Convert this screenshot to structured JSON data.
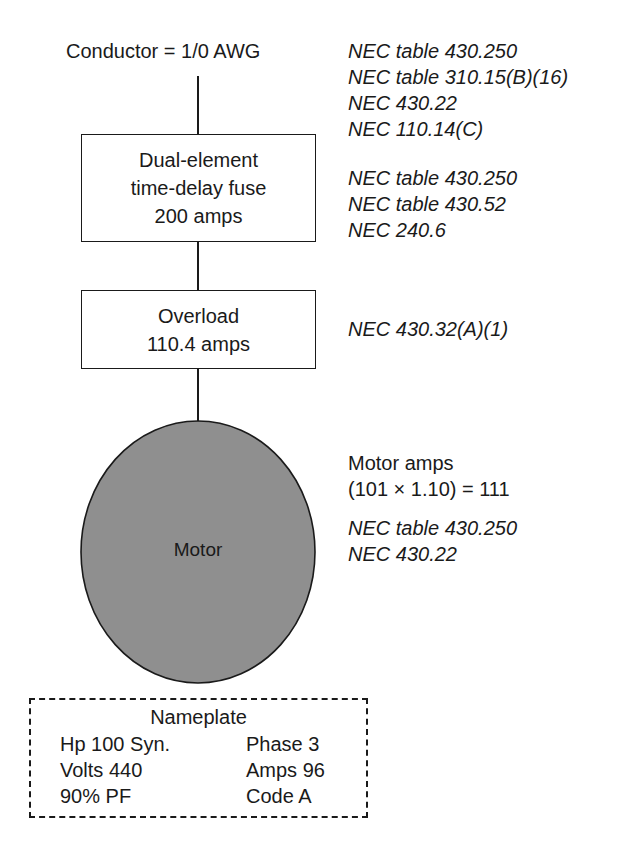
{
  "diagram": {
    "conductor_label": "Conductor = 1/0 AWG",
    "conductor_refs": [
      "NEC table 430.250",
      "NEC table 310.15(B)(16)",
      "NEC 430.22",
      "NEC 110.14(C)"
    ],
    "fuse": {
      "lines": [
        "Dual-element",
        "time-delay fuse",
        "200 amps"
      ],
      "refs": [
        "NEC table 430.250",
        "NEC table 430.52",
        "NEC 240.6"
      ]
    },
    "overload": {
      "lines": [
        "Overload",
        "110.4 amps"
      ],
      "refs": [
        "NEC 430.32(A)(1)"
      ]
    },
    "motor": {
      "label": "Motor",
      "fill_color": "#8f8f8f",
      "amps_lines": [
        "Motor amps",
        "(101 × 1.10) = 111"
      ],
      "refs": [
        "NEC table 430.250",
        "NEC 430.22"
      ]
    },
    "nameplate": {
      "title": "Nameplate",
      "left": [
        "Hp 100 Syn.",
        "Volts 440",
        "90% PF"
      ],
      "right": [
        "Phase 3",
        "Amps 96",
        "Code A"
      ]
    }
  }
}
